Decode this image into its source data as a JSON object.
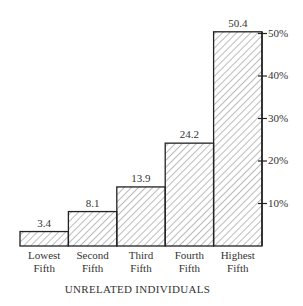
{
  "chart_data": {
    "type": "bar",
    "title": "UNRELATED INDIVIDUALS",
    "xlabel": "",
    "ylabel": "",
    "categories": [
      "Lowest Fifth",
      "Second Fifth",
      "Third Fifth",
      "Fourth Fifth",
      "Highest Fifth"
    ],
    "category_lines": [
      [
        "Lowest",
        "Fifth"
      ],
      [
        "Second",
        "Fifth"
      ],
      [
        "Third",
        "Fifth"
      ],
      [
        "Fourth",
        "Fifth"
      ],
      [
        "Highest",
        "Fifth"
      ]
    ],
    "values": [
      3.4,
      8.1,
      13.9,
      24.2,
      50.4
    ],
    "value_labels": [
      "3.4",
      "8.1",
      "13.9",
      "24.2",
      "50.4"
    ],
    "y_ticks": [
      10,
      20,
      30,
      40,
      50
    ],
    "y_tick_labels": [
      "10%",
      "20%",
      "30%",
      "40%",
      "50%"
    ],
    "ylim": [
      0,
      50.4
    ],
    "y_axis_position": "right",
    "grid": false,
    "legend": null,
    "bar_fill": "diagonal-hatch",
    "bar_stroke": "#222222"
  }
}
